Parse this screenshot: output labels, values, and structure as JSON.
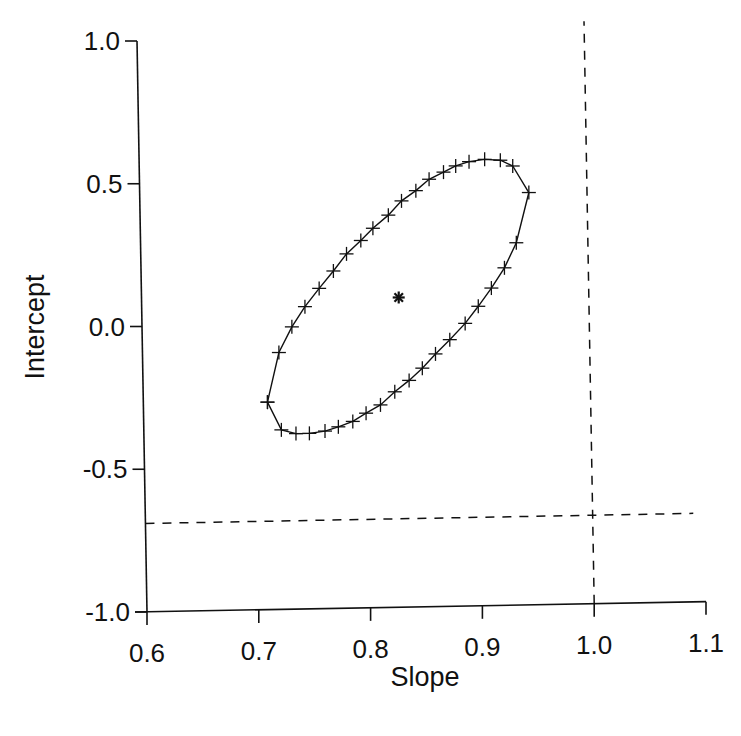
{
  "chart_data": {
    "type": "scatter",
    "title": "",
    "xlabel": "Slope",
    "ylabel": "Intercept",
    "xlim": [
      0.6,
      1.1
    ],
    "ylim": [
      -1.0,
      1.0
    ],
    "x_ticks": [
      0.6,
      0.7,
      0.8,
      0.9,
      1.0,
      1.1
    ],
    "x_tick_labels": [
      "0.6",
      "0.7",
      "0.8",
      "0.9",
      "1.0",
      "1.1"
    ],
    "y_ticks": [
      -1.0,
      -0.5,
      0.0,
      0.5,
      1.0
    ],
    "y_tick_labels": [
      "-1.0",
      "-0.5",
      "0.0",
      "0.5",
      "1.0"
    ],
    "grid": false,
    "legend": null,
    "series": [
      {
        "name": "confidence-ellipse",
        "marker": "+",
        "line": "solid",
        "closed": true,
        "points": [
          [
            0.711,
            -0.273
          ],
          [
            0.722,
            -0.1
          ],
          [
            0.734,
            -0.011
          ],
          [
            0.746,
            0.059
          ],
          [
            0.759,
            0.122
          ],
          [
            0.772,
            0.182
          ],
          [
            0.784,
            0.241
          ],
          [
            0.797,
            0.287
          ],
          [
            0.808,
            0.329
          ],
          [
            0.822,
            0.374
          ],
          [
            0.834,
            0.423
          ],
          [
            0.847,
            0.458
          ],
          [
            0.859,
            0.497
          ],
          [
            0.872,
            0.521
          ],
          [
            0.883,
            0.542
          ],
          [
            0.895,
            0.556
          ],
          [
            0.909,
            0.563
          ],
          [
            0.923,
            0.559
          ],
          [
            0.934,
            0.538
          ],
          [
            0.948,
            0.444
          ],
          [
            0.936,
            0.269
          ],
          [
            0.925,
            0.182
          ],
          [
            0.913,
            0.112
          ],
          [
            0.901,
            0.049
          ],
          [
            0.889,
            -0.01
          ],
          [
            0.875,
            -0.066
          ],
          [
            0.862,
            -0.115
          ],
          [
            0.85,
            -0.164
          ],
          [
            0.838,
            -0.206
          ],
          [
            0.825,
            -0.245
          ],
          [
            0.812,
            -0.29
          ],
          [
            0.799,
            -0.318
          ],
          [
            0.787,
            -0.346
          ],
          [
            0.774,
            -0.364
          ],
          [
            0.762,
            -0.378
          ],
          [
            0.748,
            -0.385
          ],
          [
            0.736,
            -0.385
          ],
          [
            0.723,
            -0.371
          ],
          [
            0.711,
            -0.273
          ]
        ]
      },
      {
        "name": "estimate",
        "marker": "*",
        "points": [
          [
            0.83,
            0.085
          ]
        ]
      }
    ],
    "reference_lines": [
      {
        "orientation": "vertical",
        "value": 1.0,
        "style": "dashed"
      },
      {
        "orientation": "horizontal",
        "value": -0.69,
        "style": "dashed"
      }
    ]
  }
}
